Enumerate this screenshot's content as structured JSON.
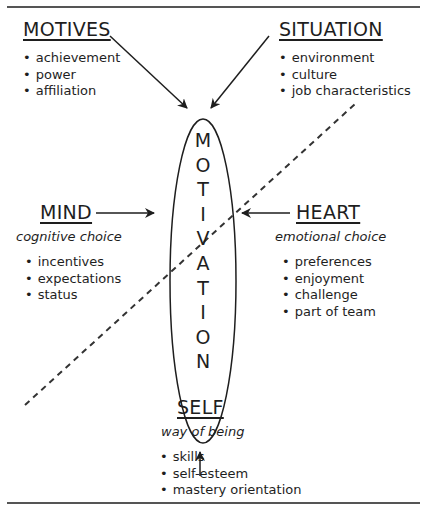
{
  "diagram": {
    "central_concept": "MOTIVATION",
    "central_letters": [
      "M",
      "O",
      "T",
      "I",
      "V",
      "A",
      "T",
      "I",
      "O",
      "N"
    ],
    "motives": {
      "title": "MOTIVES",
      "items": [
        "achievement",
        "power",
        "affiliation"
      ]
    },
    "situation": {
      "title": "SITUATION",
      "items": [
        "environment",
        "culture",
        "job characteristics"
      ]
    },
    "mind": {
      "title": "MIND",
      "subtitle": "cognitive choice",
      "items": [
        "incentives",
        "expectations",
        "status"
      ]
    },
    "heart": {
      "title": "HEART",
      "subtitle": "emotional choice",
      "items": [
        "preferences",
        "enjoyment",
        "challenge",
        "part of team"
      ]
    },
    "self": {
      "title": "SELF",
      "subtitle": "way of being",
      "items": [
        "skills",
        "self-esteem",
        "mastery orientation"
      ]
    },
    "colors": {
      "ink": "#1e1e1e",
      "rule": "#555555",
      "background": "#ffffff"
    }
  }
}
